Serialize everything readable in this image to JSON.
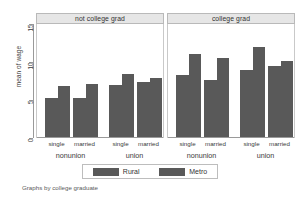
{
  "caption": "Graphs by college graduate",
  "axis": {
    "ylabel": "mean of wage",
    "yticks": [
      "0",
      "5",
      "10",
      "15"
    ],
    "ymin": 0,
    "ymax": 15
  },
  "legend": {
    "items": [
      {
        "label": "Rural",
        "color": "#595959"
      },
      {
        "label": "Metro",
        "color": "#595959"
      }
    ]
  },
  "panels": [
    {
      "title": "not college grad"
    },
    {
      "title": "college grad"
    }
  ],
  "xlabels": {
    "sub": [
      "single",
      "married"
    ],
    "groups": [
      "nonunion",
      "union"
    ]
  },
  "chart_data": {
    "type": "bar",
    "title": "",
    "subtitle": "",
    "xlabel": "",
    "ylabel": "mean of wage",
    "ylim": [
      0,
      15
    ],
    "yticks": [
      0,
      5,
      10,
      15
    ],
    "grid": false,
    "legend_position": "bottom",
    "panel_variable": "college graduate",
    "panels": [
      {
        "name": "not college grad",
        "categories": [
          "nonunion / single",
          "nonunion / married",
          "union / single",
          "union / married"
        ],
        "series": [
          {
            "name": "Rural",
            "values": [
              5.2,
              5.2,
              6.9,
              7.3
            ]
          },
          {
            "name": "Metro",
            "values": [
              6.8,
              7.0,
              8.3,
              7.8
            ]
          }
        ]
      },
      {
        "name": "college grad",
        "categories": [
          "nonunion / single",
          "nonunion / married",
          "union / single",
          "union / married"
        ],
        "series": [
          {
            "name": "Rural",
            "values": [
              8.2,
              7.6,
              8.9,
              9.4
            ]
          },
          {
            "name": "Metro",
            "values": [
              11.0,
              10.5,
              12.0,
              10.1
            ]
          }
        ]
      }
    ]
  }
}
